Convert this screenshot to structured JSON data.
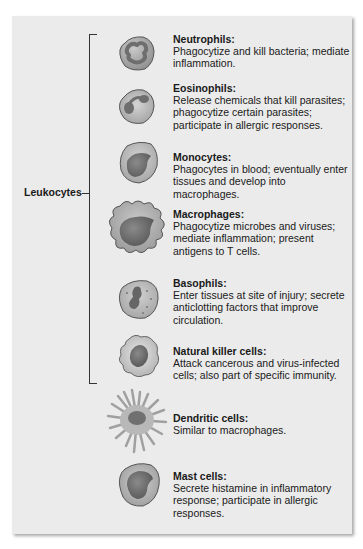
{
  "group_label": "Leukocytes",
  "cells": [
    {
      "id": "neutrophils",
      "title": "Neutrophils:",
      "description": "Phagocytize and kill bacteria; mediate inflammation.",
      "in_leukocyte_group": true
    },
    {
      "id": "eosinophils",
      "title": "Eosinophils:",
      "description": "Release chemicals that kill parasites; phagocytize certain parasites; participate in allergic responses.",
      "in_leukocyte_group": true
    },
    {
      "id": "monocytes",
      "title": "Monocytes:",
      "description": "Phagocytes in blood; eventually enter tissues and develop into macrophages.",
      "in_leukocyte_group": true
    },
    {
      "id": "macrophages",
      "title": "Macrophages:",
      "description": "Phagocytize microbes and viruses; mediate inflammation; present antigens to T cells.",
      "in_leukocyte_group": true
    },
    {
      "id": "basophils",
      "title": "Basophils:",
      "description": "Enter tissues at site of injury; secrete anticlotting factors that improve circulation.",
      "in_leukocyte_group": true
    },
    {
      "id": "natural-killer-cells",
      "title": "Natural killer cells:",
      "description": "Attack cancerous and virus-infected cells; also part of specific immunity.",
      "in_leukocyte_group": true
    },
    {
      "id": "dendritic-cells",
      "title": "Dendritic cells:",
      "description": "Similar to macrophages.",
      "in_leukocyte_group": false
    },
    {
      "id": "mast-cells",
      "title": "Mast cells:",
      "description": "Secrete histamine in inflammatory response; participate in allergic responses.",
      "in_leukocyte_group": false
    }
  ],
  "colors": {
    "panel": "#ebebeb",
    "cell_body": "#b5b5b5",
    "nucleus": "#6e6e6e",
    "outline": "#555555"
  }
}
